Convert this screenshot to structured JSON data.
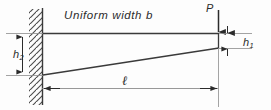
{
  "figure": {
    "background_color": "#fdfdfd",
    "line_color": "#3a3a3a",
    "thin_line_color": "#6e6e6e",
    "width": 271,
    "height": 110
  },
  "labels": {
    "uniform_width": "Uniform width b",
    "height_root": "h",
    "height_root_sub": "2",
    "height_tip": "h",
    "height_tip_sub": "1",
    "load": "P",
    "length": "ℓ"
  },
  "elements": {
    "wall": "fixed-support-hatched-wall",
    "beam": "tapered-cantilever-beam",
    "load_arrow": "downward-point-load-arrow",
    "dim_h2": "vertical-dimension-root-depth",
    "dim_h1": "vertical-dimension-tip-depth",
    "dim_length": "horizontal-dimension-span-length"
  },
  "geometry": {
    "wall_x": 42,
    "beam_top_y": 33,
    "beam_tip_x": 218,
    "beam_root_bottom_y": 75,
    "beam_tip_bottom_y": 48,
    "length_dim_y": 88,
    "h2_dim_x": 22,
    "h1_dim_x": 227,
    "load_arrow_x": 218,
    "load_arrow_top_y": 10
  }
}
